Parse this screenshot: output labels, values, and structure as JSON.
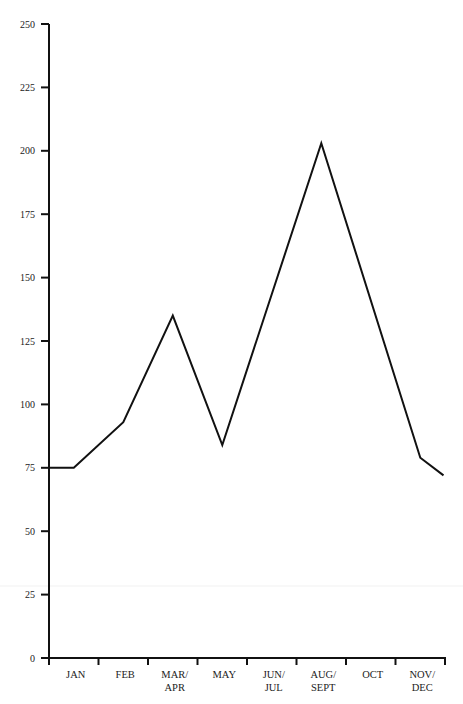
{
  "chart_data": {
    "type": "line",
    "title": "",
    "xlabel": "",
    "ylabel": "",
    "ylim": [
      0,
      250
    ],
    "yticks": [
      0,
      25,
      50,
      75,
      100,
      125,
      150,
      175,
      200,
      225,
      250
    ],
    "grid": false,
    "legend": null,
    "categories": [
      "JAN",
      "FEB",
      "MAR/APR",
      "MAY",
      "JUN/JUL",
      "AUG/SEPT",
      "OCT",
      "NOV/DEC"
    ],
    "category_labels": [
      [
        "JAN"
      ],
      [
        "FEB"
      ],
      [
        "MAR/",
        "APR"
      ],
      [
        "MAY"
      ],
      [
        "JUN/",
        "JUL"
      ],
      [
        "AUG/",
        "SEPT"
      ],
      [
        "OCT"
      ],
      [
        "NOV/",
        "DEC"
      ]
    ],
    "series": [
      {
        "name": "series",
        "color": "#111111",
        "start_value": 75,
        "values": [
          75,
          93,
          135,
          84,
          143,
          203,
          140,
          79
        ],
        "end_value": 72
      }
    ],
    "line_vertices": [
      {
        "x_frac": 0.0,
        "y": 75
      },
      {
        "x_frac": 0.5,
        "y": 75
      },
      {
        "x_frac": 1.5,
        "y": 93
      },
      {
        "x_frac": 2.5,
        "y": 135
      },
      {
        "x_frac": 3.5,
        "y": 84
      },
      {
        "x_frac": 5.5,
        "y": 203
      },
      {
        "x_frac": 7.5,
        "y": 79
      },
      {
        "x_frac": 7.97,
        "y": 72
      }
    ]
  }
}
